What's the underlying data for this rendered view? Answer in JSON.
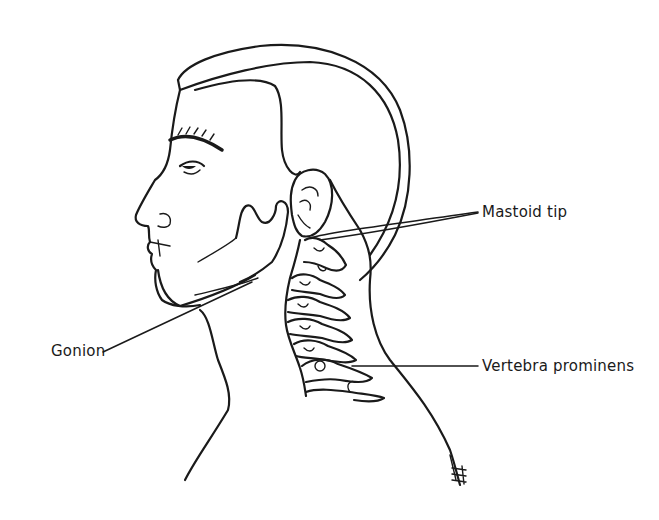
{
  "figure": {
    "labels": [
      {
        "id": "mastoid-tip",
        "text": "Mastoid tip"
      },
      {
        "id": "vertebra-prominens",
        "text": "Vertebra prominens"
      },
      {
        "id": "gonion",
        "text": "Gonion"
      }
    ],
    "line_color": "#1a1a1a",
    "background": "#ffffff"
  }
}
